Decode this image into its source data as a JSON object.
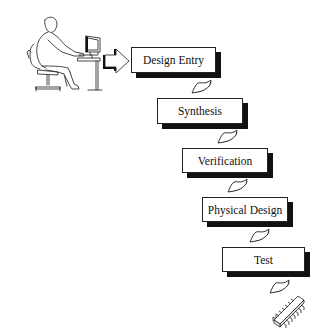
{
  "diagram": {
    "actor": {
      "icon": "person-at-computer-icon",
      "description": "Designer seated at desk with computer"
    },
    "entry_arrow": {
      "icon": "block-arrow-right-icon"
    },
    "steps": [
      {
        "label": "Design Entry"
      },
      {
        "label": "Synthesis"
      },
      {
        "label": "Verification"
      },
      {
        "label": "Physical Design"
      },
      {
        "label": "Test"
      }
    ],
    "connectors": {
      "icon": "curved-arrow-down-icon",
      "count": 5
    },
    "output": {
      "icon": "ic-chip-icon",
      "description": "Integrated circuit chip"
    },
    "colors": {
      "background": "#ffffff",
      "stroke": "#222222",
      "shadow": "#111111",
      "text": "#111111"
    }
  }
}
